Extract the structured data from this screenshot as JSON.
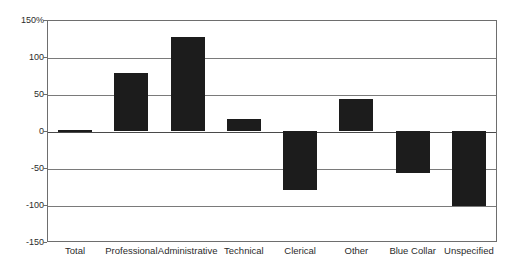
{
  "chart_data": {
    "type": "bar",
    "title": "",
    "subtitle": "",
    "xlabel": "",
    "ylabel": "",
    "categories": [
      "Total",
      "Professional",
      "Administrative",
      "Technical",
      "Clerical",
      "Other",
      "Blue Collar",
      "Unspecified"
    ],
    "values": [
      2,
      78,
      127,
      16,
      -80,
      43,
      -57,
      -102
    ],
    "ylim": [
      -150,
      150
    ],
    "ytick_labels": [
      "150%",
      "100",
      "50",
      "0",
      "-50",
      "-100",
      "-150"
    ],
    "ytick_values": [
      150,
      100,
      50,
      0,
      -50,
      -100,
      -150
    ],
    "grid": true,
    "legend": "none",
    "series": [
      {
        "name": "",
        "values": [
          2,
          78,
          127,
          16,
          -80,
          43,
          -57,
          -102
        ],
        "color": "#1c1c1c"
      }
    ],
    "annotations": []
  },
  "colors": {
    "bar": "#1c1c1c",
    "grid": "#7a7a7a",
    "axis": "#6e6e6e",
    "zero_line": "#4a4a4a",
    "background": "#ffffff",
    "text": "#2b2b2b"
  }
}
